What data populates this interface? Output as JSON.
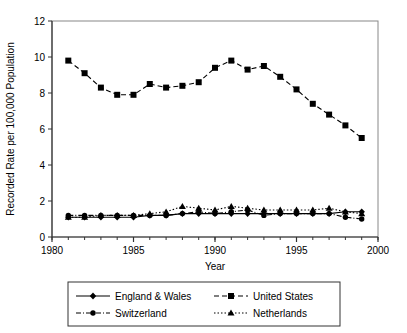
{
  "chart": {
    "title": "",
    "xlabel": "Year",
    "ylabel": "Recorded Rate per 100,000 Population",
    "y_ticks": [
      "0",
      "2",
      "4",
      "6",
      "8",
      "10",
      "12"
    ],
    "x_ticks": [
      "1980",
      "1985",
      "1990",
      "1995",
      "2000"
    ]
  },
  "legend": {
    "items": [
      {
        "label": "England & Wales",
        "marker": "diamond",
        "line": "solid"
      },
      {
        "label": "United States",
        "marker": "square",
        "line": "dashed"
      },
      {
        "label": "Switzerland",
        "marker": "circle",
        "line": "dash-dot"
      },
      {
        "label": "Netherlands",
        "marker": "triangle",
        "line": "dotted"
      }
    ]
  },
  "chart_data": {
    "type": "line",
    "title": "",
    "xlabel": "Year",
    "ylabel": "Recorded Rate per 100,000 Population",
    "xlim": [
      1980,
      2000
    ],
    "ylim": [
      0,
      12
    ],
    "xtick_step": 5,
    "xtick_minor_step": 1,
    "ytick_step": 2,
    "grid": false,
    "legend_position": "bottom",
    "x": [
      1981,
      1982,
      1983,
      1984,
      1985,
      1986,
      1987,
      1988,
      1989,
      1990,
      1991,
      1992,
      1993,
      1994,
      1995,
      1996,
      1997,
      1998,
      1999
    ],
    "series": [
      {
        "name": "England & Wales",
        "marker": "diamond",
        "line": "solid",
        "color": "#000000",
        "values": [
          1.1,
          1.1,
          1.1,
          1.1,
          1.1,
          1.2,
          1.2,
          1.3,
          1.3,
          1.3,
          1.3,
          1.3,
          1.3,
          1.3,
          1.3,
          1.3,
          1.3,
          1.4,
          1.4
        ]
      },
      {
        "name": "United States",
        "marker": "square",
        "line": "dashed",
        "color": "#000000",
        "values": [
          9.8,
          9.1,
          8.3,
          7.9,
          7.9,
          8.5,
          8.3,
          8.4,
          8.6,
          9.4,
          9.8,
          9.3,
          9.5,
          8.9,
          8.2,
          7.4,
          6.8,
          6.2,
          5.5
        ]
      },
      {
        "name": "Switzerland",
        "marker": "circle",
        "line": "dash-dot",
        "color": "#000000",
        "values": [
          1.2,
          1.2,
          1.2,
          1.2,
          1.2,
          1.2,
          1.2,
          1.3,
          1.4,
          1.3,
          1.4,
          1.5,
          1.2,
          1.3,
          1.3,
          1.3,
          1.3,
          1.1,
          1.0
        ]
      },
      {
        "name": "Netherlands",
        "marker": "triangle",
        "line": "dotted",
        "color": "#000000",
        "values": [
          1.1,
          1.1,
          1.2,
          1.2,
          1.2,
          1.3,
          1.4,
          1.7,
          1.6,
          1.5,
          1.7,
          1.6,
          1.5,
          1.5,
          1.5,
          1.5,
          1.6,
          1.4,
          1.3
        ]
      }
    ]
  }
}
